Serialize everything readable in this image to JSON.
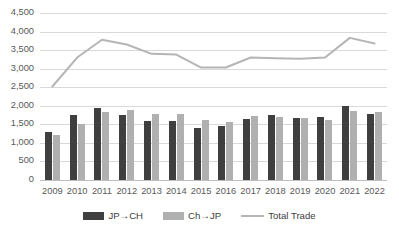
{
  "chart_data": {
    "type": "bar",
    "title": "",
    "subtitle": "",
    "xlabel": "",
    "ylabel": "",
    "ylim": [
      0,
      4500
    ],
    "ytick_step": 500,
    "grid": true,
    "legend_position": "bottom",
    "categories": [
      "2009",
      "2010",
      "2011",
      "2012",
      "2013",
      "2014",
      "2015",
      "2016",
      "2017",
      "2018",
      "2019",
      "2020",
      "2021",
      "2022"
    ],
    "ytick_labels": [
      "4,500",
      "4,000",
      "3,500",
      "3,000",
      "2,500",
      "2,000",
      "1,500",
      "1,000",
      "500",
      "0"
    ],
    "ytick_values": [
      4500,
      4000,
      3500,
      3000,
      2500,
      2000,
      1500,
      1000,
      500,
      0
    ],
    "series": [
      {
        "name": "JP→CH",
        "kind": "bar",
        "color": "#3f3f3f",
        "values": [
          1300,
          1750,
          1950,
          1760,
          1600,
          1600,
          1400,
          1450,
          1650,
          1750,
          1680,
          1700,
          2000,
          1780
        ]
      },
      {
        "name": "Ch→JP",
        "kind": "bar",
        "color": "#b0b0b0",
        "values": [
          1220,
          1520,
          1830,
          1880,
          1780,
          1780,
          1620,
          1550,
          1720,
          1710,
          1680,
          1630,
          1850,
          1820
        ]
      },
      {
        "name": "Total Trade",
        "kind": "line",
        "color": "#b5b5b5",
        "values": [
          2520,
          3300,
          3780,
          3650,
          3400,
          3380,
          3030,
          3030,
          3300,
          3280,
          3270,
          3300,
          3830,
          3680
        ]
      }
    ]
  },
  "legend": {
    "items": [
      {
        "label": "JP→CH",
        "swatch": "bar-dark-swatch"
      },
      {
        "label": "Ch→JP",
        "swatch": "bar-light-swatch"
      },
      {
        "label": "Total Trade",
        "swatch": "line-swatch"
      }
    ]
  },
  "colors": {
    "bar_dark": "#3f3f3f",
    "bar_light": "#b0b0b0",
    "line": "#b5b5b5",
    "gridline": "#d9d9d9",
    "axis_text": "#595959",
    "background": "#ffffff"
  }
}
